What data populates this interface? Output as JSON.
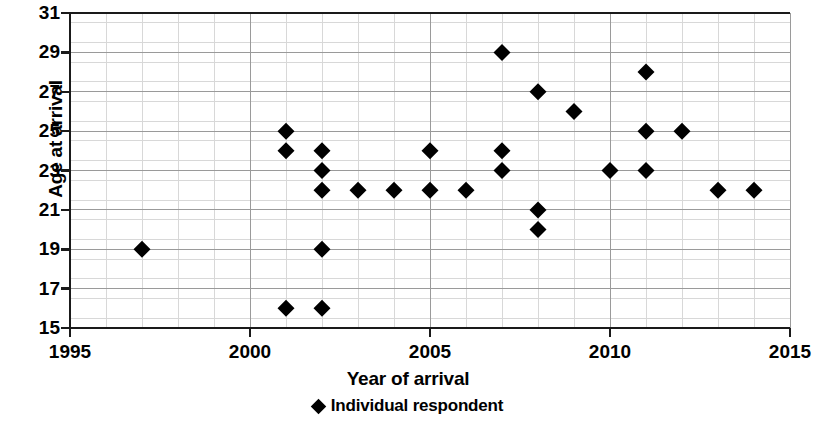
{
  "chart_data": {
    "type": "scatter",
    "title": "",
    "xlabel": "Year of arrival",
    "ylabel": "Age at arrival",
    "xlim": [
      1995,
      2015
    ],
    "ylim": [
      15,
      31
    ],
    "xticks": [
      1995,
      2000,
      2005,
      2010,
      2015
    ],
    "yticks": [
      15,
      17,
      19,
      21,
      23,
      25,
      27,
      29,
      31
    ],
    "grid": true,
    "grid_minor": true,
    "legend": {
      "position": "below-axis-center",
      "entries": [
        {
          "label": "Individual respondent",
          "marker": "diamond",
          "color": "#000000"
        }
      ]
    },
    "series": [
      {
        "name": "Individual respondent",
        "marker": "diamond",
        "color": "#000000",
        "points": [
          {
            "x": 1997,
            "y": 19
          },
          {
            "x": 2001,
            "y": 25
          },
          {
            "x": 2001,
            "y": 24
          },
          {
            "x": 2001,
            "y": 16
          },
          {
            "x": 2002,
            "y": 24
          },
          {
            "x": 2002,
            "y": 23
          },
          {
            "x": 2002,
            "y": 22
          },
          {
            "x": 2002,
            "y": 19
          },
          {
            "x": 2002,
            "y": 16
          },
          {
            "x": 2003,
            "y": 22
          },
          {
            "x": 2004,
            "y": 22
          },
          {
            "x": 2005,
            "y": 24
          },
          {
            "x": 2005,
            "y": 22
          },
          {
            "x": 2006,
            "y": 22
          },
          {
            "x": 2007,
            "y": 29
          },
          {
            "x": 2007,
            "y": 24
          },
          {
            "x": 2007,
            "y": 23
          },
          {
            "x": 2008,
            "y": 27
          },
          {
            "x": 2008,
            "y": 21
          },
          {
            "x": 2008,
            "y": 20
          },
          {
            "x": 2009,
            "y": 26
          },
          {
            "x": 2010,
            "y": 23
          },
          {
            "x": 2011,
            "y": 28
          },
          {
            "x": 2011,
            "y": 25
          },
          {
            "x": 2011,
            "y": 23
          },
          {
            "x": 2012,
            "y": 25
          },
          {
            "x": 2013,
            "y": 22
          },
          {
            "x": 2014,
            "y": 22
          }
        ]
      }
    ],
    "colors": {
      "marker": "#000000",
      "axis": "#1a1a1a",
      "grid_major": "#9a9a9a",
      "grid_minor": "#d8d8d8",
      "background": "#ffffff"
    }
  },
  "axis": {
    "y_label": "Age at arrival",
    "x_label": "Year of arrival",
    "y_tick_labels": [
      "31",
      "29",
      "27",
      "25",
      "23",
      "21",
      "19",
      "17",
      "15"
    ],
    "x_tick_labels": [
      "1995",
      "2000",
      "2005",
      "2010",
      "2015"
    ]
  },
  "legend": {
    "marker_glyph": "diamond-marker-icon",
    "label": "Individual respondent"
  }
}
